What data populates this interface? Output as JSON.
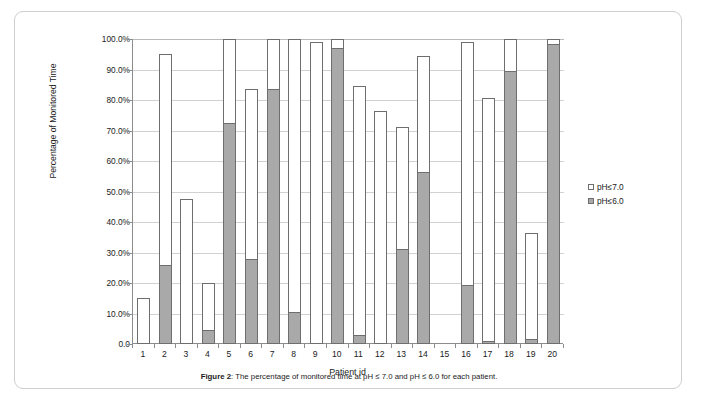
{
  "figure": {
    "caption_label": "Figure 2",
    "caption_separator": ": ",
    "caption_text": "The percentage of monitored time at pH ≤ 7.0 and pH ≤ 6.0 for each patient."
  },
  "legend": {
    "position": "right",
    "entries": [
      {
        "label": "pH≤7.0",
        "color": "#ffffff",
        "name": "ph7"
      },
      {
        "label": "pH≤6.0",
        "color": "#a9a9a9",
        "name": "ph6"
      }
    ]
  },
  "axes": {
    "ylabel": "Percentage of Monitored Time",
    "xlabel": "Patient id",
    "yticks": [
      "100.0%",
      "90.0%",
      "80.0%",
      "70.0%",
      "60.0%",
      "50.0%",
      "40.0%",
      "30.0%",
      "20.0%",
      "10.0%",
      "0.0"
    ]
  },
  "chart_data": {
    "type": "bar",
    "title": "",
    "subtitle": "",
    "xlabel": "Patient id",
    "ylabel": "Percentage of Monitored Time",
    "ylim": [
      0,
      100
    ],
    "ytick_values": [
      0,
      10,
      20,
      30,
      40,
      50,
      60,
      70,
      80,
      90,
      100
    ],
    "ytick_labels": [
      "0.0",
      "10.0%",
      "20.0%",
      "30.0%",
      "40.0%",
      "50.0%",
      "60.0%",
      "70.0%",
      "80.0%",
      "90.0%",
      "100.0%"
    ],
    "grid": true,
    "legend_position": "right",
    "bar_style": "overlapping",
    "categories": [
      "1",
      "2",
      "3",
      "4",
      "5",
      "6",
      "7",
      "8",
      "9",
      "10",
      "11",
      "12",
      "13",
      "14",
      "15",
      "16",
      "17",
      "18",
      "19",
      "20"
    ],
    "series": [
      {
        "name": "pH≤7.0",
        "color": "#ffffff",
        "values": [
          15.0,
          95.0,
          47.5,
          20.0,
          100.0,
          83.5,
          100.0,
          100.0,
          99.0,
          100.0,
          84.5,
          76.5,
          71.0,
          94.5,
          0.0,
          99.0,
          80.5,
          100.0,
          36.5,
          100.0
        ]
      },
      {
        "name": "pH≤6.0",
        "color": "#a9a9a9",
        "values": [
          0.0,
          26.0,
          0.0,
          4.5,
          72.5,
          28.0,
          83.5,
          10.5,
          0.0,
          97.0,
          3.0,
          0.0,
          31.0,
          56.5,
          0.0,
          19.5,
          1.0,
          89.5,
          1.5,
          98.5
        ]
      }
    ]
  }
}
